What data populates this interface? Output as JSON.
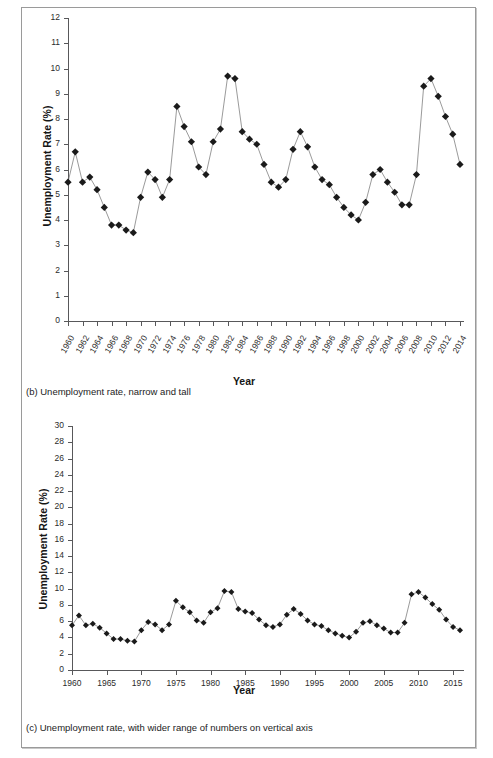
{
  "figure": {
    "panels": [
      {
        "id": "panel-b",
        "caption": "(b) Unemployment rate, narrow and tall"
      },
      {
        "id": "panel-c",
        "caption": "(c) Unemployment rate, with wider range of numbers on vertical axis"
      }
    ]
  },
  "chart_data": [
    {
      "type": "line",
      "id": "chart-b",
      "title": "",
      "xlabel": "Year",
      "ylabel": "Unemployment Rate (%)",
      "ylim": [
        0,
        12
      ],
      "yticks": [
        0,
        1,
        2,
        3,
        4,
        5,
        6,
        7,
        8,
        9,
        10,
        11,
        12
      ],
      "ytick_labels": [
        "0",
        "1",
        "2",
        "3",
        "4",
        "5",
        "6",
        "7",
        "8",
        "9",
        "10",
        "11",
        "12"
      ],
      "xlim": [
        1960,
        2014
      ],
      "xticks": [
        1960,
        1962,
        1964,
        1966,
        1968,
        1970,
        1972,
        1974,
        1976,
        1978,
        1980,
        1982,
        1984,
        1986,
        1988,
        1990,
        1992,
        1994,
        1996,
        1998,
        2000,
        2002,
        2004,
        2006,
        2008,
        2010,
        2012,
        2014
      ],
      "xtick_labels": [
        "1960",
        "1962",
        "1964",
        "1966",
        "1968",
        "1970",
        "1972",
        "1974",
        "1976",
        "1978",
        "1980",
        "1982",
        "1984",
        "1986",
        "1988",
        "1990",
        "1992",
        "1994",
        "1996",
        "1998",
        "2000",
        "2002",
        "2004",
        "2006",
        "2008",
        "2010",
        "2012",
        "2014"
      ],
      "grid": false,
      "legend": "none",
      "marker": "diamond",
      "x": [
        1960,
        1961,
        1962,
        1963,
        1964,
        1965,
        1966,
        1967,
        1968,
        1969,
        1970,
        1971,
        1972,
        1973,
        1974,
        1975,
        1976,
        1977,
        1978,
        1979,
        1980,
        1981,
        1982,
        1983,
        1984,
        1985,
        1986,
        1987,
        1988,
        1989,
        1990,
        1991,
        1992,
        1993,
        1994,
        1995,
        1996,
        1997,
        1998,
        1999,
        2000,
        2001,
        2002,
        2003,
        2004,
        2005,
        2006,
        2007,
        2008,
        2009,
        2010,
        2011,
        2012,
        2013,
        2014
      ],
      "values": [
        5.5,
        6.7,
        5.5,
        5.7,
        5.2,
        4.5,
        3.8,
        3.8,
        3.6,
        3.5,
        4.9,
        5.9,
        5.6,
        4.9,
        5.6,
        8.5,
        7.7,
        7.1,
        6.1,
        5.8,
        7.1,
        7.6,
        9.7,
        9.6,
        7.5,
        7.2,
        7.0,
        6.2,
        5.5,
        5.3,
        5.6,
        6.8,
        7.5,
        6.9,
        6.1,
        5.6,
        5.4,
        4.9,
        4.5,
        4.2,
        4.0,
        4.7,
        5.8,
        6.0,
        5.5,
        5.1,
        4.6,
        4.6,
        5.8,
        9.3,
        9.6,
        8.9,
        8.1,
        7.4,
        6.2,
        5.1
      ]
    },
    {
      "type": "line",
      "id": "chart-c",
      "title": "",
      "xlabel": "Year",
      "ylabel": "Unemployment Rate (%)",
      "ylim": [
        0,
        30
      ],
      "yticks": [
        0,
        2,
        4,
        6,
        8,
        10,
        12,
        14,
        16,
        18,
        20,
        22,
        24,
        26,
        28,
        30
      ],
      "ytick_labels": [
        "0",
        "2",
        "4",
        "6",
        "8",
        "10",
        "12",
        "14",
        "16",
        "18",
        "20",
        "22",
        "24",
        "26",
        "28",
        "30"
      ],
      "xlim": [
        1960,
        2016
      ],
      "xticks": [
        1960,
        1965,
        1970,
        1975,
        1980,
        1985,
        1990,
        1995,
        2000,
        2005,
        2010,
        2015
      ],
      "xtick_labels": [
        "1960",
        "1965",
        "1970",
        "1975",
        "1980",
        "1985",
        "1990",
        "1995",
        "2000",
        "2005",
        "2010",
        "2015"
      ],
      "grid": false,
      "legend": "none",
      "marker": "diamond",
      "x": [
        1960,
        1961,
        1962,
        1963,
        1964,
        1965,
        1966,
        1967,
        1968,
        1969,
        1970,
        1971,
        1972,
        1973,
        1974,
        1975,
        1976,
        1977,
        1978,
        1979,
        1980,
        1981,
        1982,
        1983,
        1984,
        1985,
        1986,
        1987,
        1988,
        1989,
        1990,
        1991,
        1992,
        1993,
        1994,
        1995,
        1996,
        1997,
        1998,
        1999,
        2000,
        2001,
        2002,
        2003,
        2004,
        2005,
        2006,
        2007,
        2008,
        2009,
        2010,
        2011,
        2012,
        2013,
        2014,
        2015,
        2016
      ],
      "values": [
        5.5,
        6.7,
        5.5,
        5.7,
        5.2,
        4.5,
        3.8,
        3.8,
        3.6,
        3.5,
        4.9,
        5.9,
        5.6,
        4.9,
        5.6,
        8.5,
        7.7,
        7.1,
        6.1,
        5.8,
        7.1,
        7.6,
        9.7,
        9.6,
        7.5,
        7.2,
        7.0,
        6.2,
        5.5,
        5.3,
        5.6,
        6.8,
        7.5,
        6.9,
        6.1,
        5.6,
        5.4,
        4.9,
        4.5,
        4.2,
        4.0,
        4.7,
        5.8,
        6.0,
        5.5,
        5.1,
        4.6,
        4.6,
        5.8,
        9.3,
        9.6,
        8.9,
        8.1,
        7.4,
        6.2,
        5.3,
        4.9
      ]
    }
  ]
}
